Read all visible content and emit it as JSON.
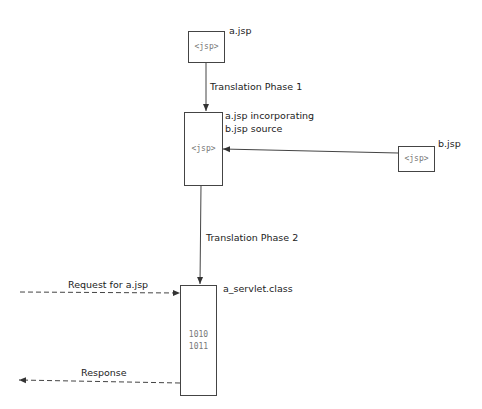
{
  "diagram": {
    "nodes": {
      "a_jsp": {
        "label": "a.jsp",
        "content": "<jsp>"
      },
      "combined": {
        "label_line1": "a.jsp incorporating",
        "label_line2": "b.jsp source",
        "content": "<jsp>"
      },
      "b_jsp": {
        "label": "b.jsp",
        "content": "<jsp>"
      },
      "servlet": {
        "label": "a_servlet.class",
        "content_line1": "1010",
        "content_line2": "1011"
      }
    },
    "edges": {
      "phase1": {
        "label": "Translation Phase 1"
      },
      "include": {
        "label": ""
      },
      "phase2": {
        "label": "Translation Phase 2"
      },
      "request": {
        "label": "Request for a.jsp"
      },
      "response": {
        "label": "Response"
      }
    },
    "colors": {
      "line": "#444444",
      "text": "#222222",
      "code": "#777777"
    }
  }
}
